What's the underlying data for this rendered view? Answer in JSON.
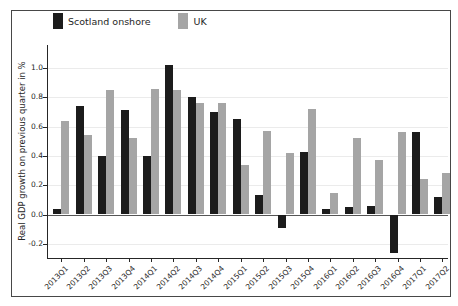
{
  "chart_data": {
    "type": "bar",
    "title": "",
    "ylabel": "Real GDP growth on previous quarter in %",
    "xlabel": "",
    "categories": [
      "2013Q1",
      "2013Q2",
      "2013Q3",
      "2013Q4",
      "2014Q1",
      "2014Q2",
      "2014Q3",
      "2014Q4",
      "2015Q1",
      "2015Q2",
      "2015Q3",
      "2015Q4",
      "2016Q1",
      "2016Q2",
      "2016Q3",
      "2016Q4",
      "2017Q1",
      "2017Q2"
    ],
    "series": [
      {
        "name": "Scotland onshore",
        "color": "#1c1c1c",
        "values": [
          0.04,
          0.74,
          0.4,
          0.71,
          0.4,
          1.02,
          0.8,
          0.7,
          0.65,
          0.13,
          -0.09,
          0.43,
          0.04,
          0.05,
          0.06,
          -0.26,
          0.56,
          0.12
        ]
      },
      {
        "name": "UK",
        "color": "#a5a5a5",
        "values": [
          0.64,
          0.54,
          0.85,
          0.52,
          0.86,
          0.85,
          0.76,
          0.76,
          0.34,
          0.57,
          0.42,
          0.72,
          0.15,
          0.52,
          0.37,
          0.56,
          0.24,
          0.28
        ]
      }
    ],
    "yticks": [
      -0.2,
      0.0,
      0.2,
      0.4,
      0.6,
      0.8,
      1.0
    ],
    "ylim": [
      -0.3,
      1.157
    ],
    "grid": true,
    "legend_position": "top-left",
    "bar_baseline": 0.0
  }
}
